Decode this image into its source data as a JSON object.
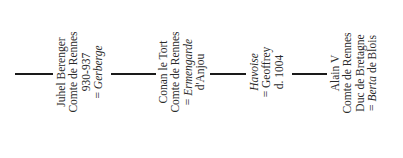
{
  "diagram": {
    "type": "genealogy-chart",
    "orientation": "rotated",
    "nodes": [
      {
        "name": "Juhel Berenger",
        "title": "Comte de Rennes",
        "dates": "930-937",
        "spouse_prefix": "= ",
        "spouse": "Gerberge"
      },
      {
        "name": "Conan le Tort",
        "title": "Comte de Rennes",
        "spouse_prefix": "= ",
        "spouse": "Ermengarde",
        "spouse_suffix": "d'Anjou"
      },
      {
        "name": "Havoise",
        "spouse_line": "= Geoffrey",
        "dates": "d. 1004"
      },
      {
        "name": "Alain V",
        "title": "Comte de Rennes",
        "title2": "Duc de Bretagne",
        "spouse_prefix": "= ",
        "spouse": "Berta",
        "spouse_suffix": " de Blois"
      }
    ]
  }
}
